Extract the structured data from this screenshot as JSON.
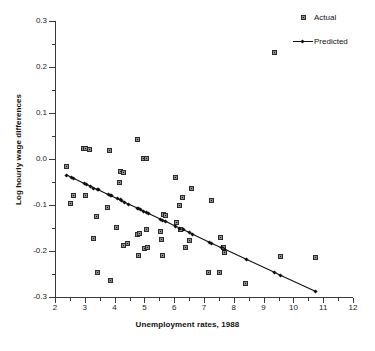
{
  "chart_data": {
    "type": "scatter",
    "title": "",
    "xlabel": "Unemployment rates, 1988",
    "ylabel": "Log hourly wage differences",
    "xlim": [
      2,
      12
    ],
    "ylim": [
      -0.3,
      0.3
    ],
    "xticks": [
      "2",
      "3",
      "4",
      "5",
      "6",
      "7",
      "8",
      "9",
      "10",
      "11",
      "12"
    ],
    "xtick_values": [
      2,
      3,
      4,
      5,
      6,
      7,
      8,
      9,
      10,
      11,
      12
    ],
    "xminor_values": [
      2.5,
      3.5,
      4.5,
      5.5,
      6.5,
      7.5,
      8.5,
      9.5,
      10.5,
      11.5
    ],
    "yticks": [
      "0.3",
      "0.2",
      "0.1",
      "0.0",
      "-0.1",
      "-0.2",
      "-0.3"
    ],
    "ytick_values": [
      0.3,
      0.2,
      0.1,
      0.0,
      -0.1,
      -0.2,
      -0.3
    ],
    "yminor_values": [
      0.25,
      0.15,
      0.05,
      -0.05,
      -0.15,
      -0.25
    ],
    "grid": false,
    "legend_position": "top-right",
    "series": [
      {
        "name": "Actual",
        "marker": "square",
        "color": "#8e8e8e",
        "edge_color": "#2b2b2b",
        "points": [
          [
            2.4,
            -0.017
          ],
          [
            2.55,
            -0.098
          ],
          [
            2.62,
            -0.08
          ],
          [
            2.98,
            0.022
          ],
          [
            3.05,
            0.021
          ],
          [
            3.18,
            0.02
          ],
          [
            3.05,
            -0.081
          ],
          [
            3.42,
            -0.125
          ],
          [
            3.45,
            -0.247
          ],
          [
            3.3,
            -0.173
          ],
          [
            3.85,
            0.018
          ],
          [
            3.78,
            -0.107
          ],
          [
            3.88,
            -0.266
          ],
          [
            4.08,
            -0.15
          ],
          [
            4.22,
            -0.028
          ],
          [
            4.33,
            -0.031
          ],
          [
            4.18,
            -0.051
          ],
          [
            4.33,
            -0.189
          ],
          [
            4.46,
            -0.185
          ],
          [
            4.78,
            0.041
          ],
          [
            4.8,
            -0.165
          ],
          [
            4.86,
            -0.162
          ],
          [
            4.82,
            -0.21
          ],
          [
            4.98,
            0.001
          ],
          [
            5.08,
            0.0
          ],
          [
            5.02,
            -0.196
          ],
          [
            5.1,
            -0.155
          ],
          [
            5.12,
            -0.194
          ],
          [
            5.55,
            -0.159
          ],
          [
            5.58,
            -0.176
          ],
          [
            5.62,
            -0.211
          ],
          [
            5.66,
            -0.121
          ],
          [
            5.72,
            -0.124
          ],
          [
            6.05,
            -0.042
          ],
          [
            6.1,
            -0.14
          ],
          [
            6.18,
            -0.102
          ],
          [
            6.22,
            -0.154
          ],
          [
            6.3,
            -0.084
          ],
          [
            6.38,
            -0.194
          ],
          [
            6.52,
            -0.178
          ],
          [
            6.6,
            -0.065
          ],
          [
            7.18,
            -0.247
          ],
          [
            7.25,
            -0.091
          ],
          [
            7.55,
            -0.247
          ],
          [
            7.58,
            -0.172
          ],
          [
            7.68,
            -0.193
          ],
          [
            7.7,
            -0.205
          ],
          [
            8.42,
            -0.271
          ],
          [
            9.38,
            0.23
          ],
          [
            9.58,
            -0.212
          ],
          [
            10.75,
            -0.215
          ]
        ]
      },
      {
        "name": "Predicted",
        "marker": "diamond-line",
        "color": "#101010",
        "points": [
          [
            2.4,
            -0.035
          ],
          [
            2.55,
            -0.04
          ],
          [
            2.62,
            -0.042
          ],
          [
            2.98,
            -0.053
          ],
          [
            3.05,
            -0.055
          ],
          [
            3.18,
            -0.059
          ],
          [
            3.3,
            -0.063
          ],
          [
            3.42,
            -0.066
          ],
          [
            3.45,
            -0.067
          ],
          [
            3.78,
            -0.077
          ],
          [
            3.85,
            -0.079
          ],
          [
            3.88,
            -0.08
          ],
          [
            4.08,
            -0.086
          ],
          [
            4.18,
            -0.089
          ],
          [
            4.22,
            -0.09
          ],
          [
            4.33,
            -0.094
          ],
          [
            4.46,
            -0.098
          ],
          [
            4.78,
            -0.107
          ],
          [
            4.8,
            -0.108
          ],
          [
            4.86,
            -0.11
          ],
          [
            4.98,
            -0.114
          ],
          [
            5.08,
            -0.117
          ],
          [
            5.12,
            -0.118
          ],
          [
            5.55,
            -0.131
          ],
          [
            5.62,
            -0.133
          ],
          [
            5.72,
            -0.136
          ],
          [
            6.05,
            -0.146
          ],
          [
            6.18,
            -0.15
          ],
          [
            6.3,
            -0.154
          ],
          [
            6.52,
            -0.16
          ],
          [
            6.6,
            -0.163
          ],
          [
            7.18,
            -0.181
          ],
          [
            7.25,
            -0.183
          ],
          [
            7.58,
            -0.193
          ],
          [
            7.7,
            -0.196
          ],
          [
            8.42,
            -0.218
          ],
          [
            9.38,
            -0.247
          ],
          [
            9.58,
            -0.253
          ],
          [
            10.75,
            -0.288
          ]
        ]
      }
    ]
  },
  "legend": {
    "items": [
      {
        "label": "Actual",
        "key": "square-marker"
      },
      {
        "label": "Predicted",
        "key": "line-diamond-marker"
      }
    ]
  }
}
